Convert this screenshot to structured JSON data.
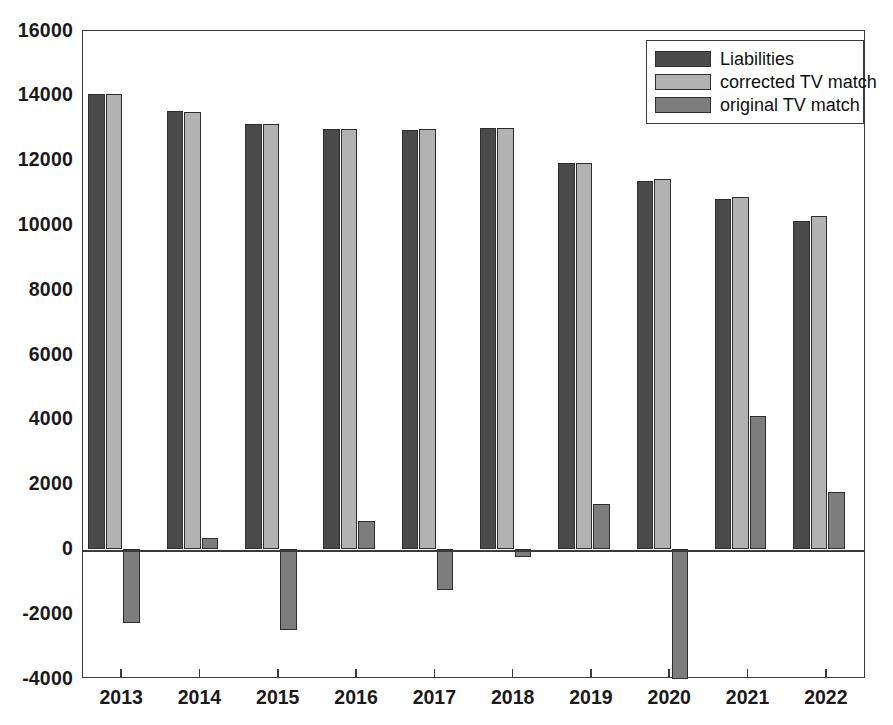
{
  "chart_data": {
    "type": "bar",
    "title": "",
    "xlabel": "",
    "ylabel": "",
    "categories": [
      "2013",
      "2014",
      "2015",
      "2016",
      "2017",
      "2018",
      "2019",
      "2020",
      "2021",
      "2022"
    ],
    "ylim": [
      -4000,
      16000
    ],
    "ytick_values": [
      16000,
      14000,
      12000,
      10000,
      8000,
      6000,
      4000,
      2000,
      0,
      -2000,
      -4000
    ],
    "ytick_labels": [
      "16000",
      "14000",
      "12000",
      "10000",
      "8000",
      "6000",
      "4000",
      "2000",
      "0",
      "-2000",
      "-4000"
    ],
    "grid": false,
    "legend_position": "top-right",
    "series": [
      {
        "name": "Liabilities",
        "color": "#4a4a4a",
        "values": [
          14060,
          13540,
          13120,
          12960,
          12950,
          13000,
          11930,
          11380,
          10810,
          10150
        ]
      },
      {
        "name": "corrected TV match",
        "color": "#b2b2b2",
        "values": [
          14070,
          13500,
          13120,
          12960,
          12960,
          13010,
          11930,
          11430,
          10880,
          10290
        ]
      },
      {
        "name": "original TV match",
        "color": "#7d7d7d",
        "values": [
          -2260,
          350,
          -2490,
          870,
          -1250,
          -250,
          1390,
          -4000,
          4110,
          1760
        ]
      }
    ]
  },
  "legend": {
    "entries": [
      {
        "label": "Liabilities"
      },
      {
        "label": "corrected TV match"
      },
      {
        "label": "original TV match"
      }
    ]
  }
}
